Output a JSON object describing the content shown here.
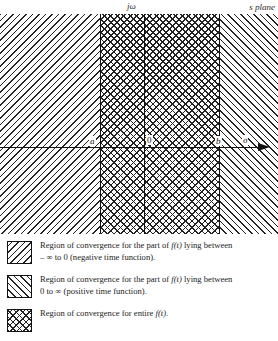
{
  "figure": {
    "plane_label": "s plane",
    "imaginary_axis_label": "jω",
    "real_axis_label": "σ",
    "origin_label": "0",
    "left_abscissa_label": "a",
    "right_abscissa_label": "b"
  },
  "chart_data": {
    "type": "region-diagram",
    "title": "s plane",
    "xlabel": "σ",
    "ylabel": "jω",
    "axis_origin": "0",
    "regions": [
      {
        "name": "negative-time-roc",
        "pattern": "backslash-hatch",
        "x_from": "-infinity",
        "x_to": "b",
        "description": "Region of convergence for the part of f(t) lying between – ∞ to 0 (negative time function)."
      },
      {
        "name": "positive-time-roc",
        "pattern": "forward-slash-hatch",
        "x_from": "a",
        "x_to": "+infinity",
        "description": "Region of convergence for the part of f(t) lying between 0 to ∞ (positive time function)."
      },
      {
        "name": "entire-roc",
        "pattern": "cross-hatch",
        "x_from": "a",
        "x_to": "b",
        "description": "Region of convergence for entire f(t)."
      }
    ],
    "boundaries": [
      {
        "label": "a",
        "position": "left"
      },
      {
        "label": "0",
        "position": "origin"
      },
      {
        "label": "b",
        "position": "right"
      }
    ]
  },
  "legend": {
    "items": [
      {
        "swatch": "backslash-hatch",
        "line1": "Region of convergence for the part of ",
        "fn": "f(t)",
        "line1_tail": " lying between",
        "line2": "– ∞ to 0 (negative time function)."
      },
      {
        "swatch": "forward-slash-hatch",
        "line1": "Region of convergence for the part of ",
        "fn": "f(t)",
        "line1_tail": " lying between",
        "line2": "0 to ∞ (positive time function)."
      },
      {
        "swatch": "cross-hatch",
        "line1": "Region of convergence for entire ",
        "fn": "f(t)",
        "line1_tail": ".",
        "line2": ""
      }
    ]
  }
}
